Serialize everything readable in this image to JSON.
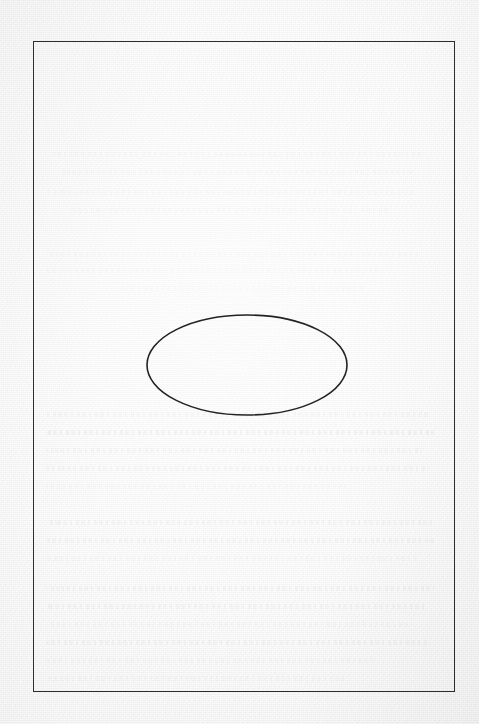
{
  "document": {
    "type": "scanned-page",
    "title": "Scanned blank page with ruled border and drawn ellipse",
    "page_label": "",
    "background_color": "#eeeeee",
    "ink_color": "#2e2e2e",
    "ghost_ink_color": "#787880",
    "visible_text": "",
    "notes_label": ""
  },
  "border_frame": {
    "name": "page-border-rule",
    "color": "#2e2e2e",
    "stroke_width_px": 1.4,
    "x": 33,
    "y": 41,
    "width": 422,
    "height": 651
  },
  "figure": {
    "name": "ellipse",
    "shape": "ellipse",
    "stroke_color": "#232323",
    "fill": "none",
    "stroke_width_px": 1.6,
    "center_x": 247,
    "center_y": 365,
    "radius_x": 100,
    "radius_y": 50,
    "caption": ""
  },
  "ghost_figure": {
    "name": "bleed-through-ellipse",
    "shape": "ellipse",
    "center_x": 247,
    "center_y": 180,
    "radius_x": 82,
    "radius_y": 26,
    "opacity": 0.22
  },
  "bleedthrough_lines": [
    {
      "x": 52,
      "y": 152,
      "width": 370,
      "weight": "faint"
    },
    {
      "x": 60,
      "y": 170,
      "width": 352,
      "weight": "faint"
    },
    {
      "x": 48,
      "y": 190,
      "width": 368,
      "weight": "faint"
    },
    {
      "x": 70,
      "y": 208,
      "width": 320,
      "weight": "faint"
    },
    {
      "x": 46,
      "y": 252,
      "width": 372,
      "weight": "faint"
    },
    {
      "x": 46,
      "y": 268,
      "width": 340,
      "weight": "faint"
    },
    {
      "x": 120,
      "y": 286,
      "width": 245,
      "weight": "faint"
    },
    {
      "x": 46,
      "y": 412,
      "width": 384,
      "weight": "light"
    },
    {
      "x": 46,
      "y": 430,
      "width": 388,
      "weight": "heavy"
    },
    {
      "x": 46,
      "y": 448,
      "width": 376,
      "weight": "light"
    },
    {
      "x": 46,
      "y": 466,
      "width": 382,
      "weight": "light"
    },
    {
      "x": 46,
      "y": 484,
      "width": 300,
      "weight": "faint"
    },
    {
      "x": 46,
      "y": 520,
      "width": 386,
      "weight": "light"
    },
    {
      "x": 46,
      "y": 538,
      "width": 390,
      "weight": "light"
    },
    {
      "x": 46,
      "y": 556,
      "width": 372,
      "weight": "faint"
    },
    {
      "x": 46,
      "y": 586,
      "width": 388,
      "weight": "light"
    },
    {
      "x": 46,
      "y": 604,
      "width": 380,
      "weight": "light"
    },
    {
      "x": 46,
      "y": 622,
      "width": 366,
      "weight": "faint"
    },
    {
      "x": 46,
      "y": 640,
      "width": 384,
      "weight": "light"
    },
    {
      "x": 46,
      "y": 658,
      "width": 330,
      "weight": "faint"
    },
    {
      "x": 46,
      "y": 676,
      "width": 300,
      "weight": "faint"
    }
  ]
}
